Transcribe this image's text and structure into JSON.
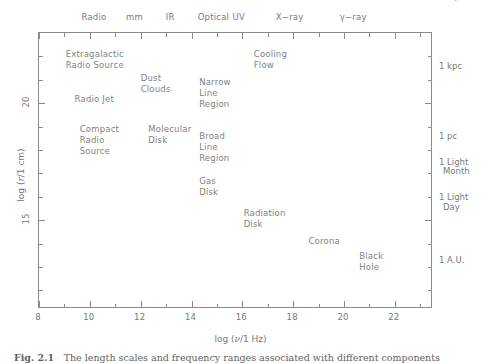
{
  "figure": {
    "caption_number": "Fig. 2.1",
    "caption_text": "The length scales and frequency ranges associated with different components"
  },
  "axes": {
    "x_title_prefix": "log (",
    "x_title_var": "ν",
    "x_title_suffix": "/1 Hz)",
    "y_title_prefix": "log (",
    "y_title_var": "r",
    "y_title_suffix": "/1 cm)",
    "x_ticks": [
      {
        "value": 8,
        "label": "8"
      },
      {
        "value": 10,
        "label": "10"
      },
      {
        "value": 12,
        "label": "12"
      },
      {
        "value": 14,
        "label": "14"
      },
      {
        "value": 16,
        "label": "16"
      },
      {
        "value": 18,
        "label": "18"
      },
      {
        "value": 20,
        "label": "20"
      },
      {
        "value": 22,
        "label": "22"
      }
    ],
    "x_minor_ticks": [
      9,
      11,
      13,
      15,
      17,
      19,
      21,
      23
    ],
    "x_range": [
      8,
      23.5
    ],
    "y_ticks": [
      {
        "value": 20,
        "label": "20"
      },
      {
        "value": 15,
        "label": "15"
      }
    ],
    "y_minor_ticks": [
      22,
      21,
      19,
      18,
      17,
      16,
      14,
      13,
      12
    ],
    "y_range": [
      11.2,
      23.0
    ]
  },
  "bands": [
    {
      "label": "Radio",
      "x": 10.2
    },
    {
      "label": "mm",
      "x": 11.8
    },
    {
      "label": "IR",
      "x": 13.2
    },
    {
      "label": "Optical",
      "x": 14.9
    },
    {
      "label": "UV",
      "x": 15.9
    },
    {
      "label": "X−ray",
      "x": 17.9
    },
    {
      "label": "γ−ray",
      "x": 20.4
    }
  ],
  "scale_markers": [
    {
      "line1": "1 Mpc",
      "line2": "",
      "y": 24.5
    },
    {
      "line1": "1 kpc",
      "line2": "",
      "y": 21.5
    },
    {
      "line1": "1 pc",
      "line2": "",
      "y": 18.5
    },
    {
      "line1": "1 Light",
      "line2": "Month",
      "y": 17.4
    },
    {
      "line1": "1 Light",
      "line2": "Day",
      "y": 15.9
    },
    {
      "line1": "1 A.U.",
      "line2": "",
      "y": 13.2
    }
  ],
  "components": [
    {
      "name": "extragalactic-radio-source",
      "lines": [
        "Extragalactic",
        "Radio Source"
      ],
      "x": 9.05,
      "y": 22.3
    },
    {
      "name": "cooling-flow",
      "lines": [
        "Cooling",
        "Flow"
      ],
      "x": 16.45,
      "y": 22.3
    },
    {
      "name": "dust-clouds",
      "lines": [
        "Dust",
        "Clouds"
      ],
      "x": 12.0,
      "y": 21.3
    },
    {
      "name": "narrow-line-region",
      "lines": [
        "Narrow",
        "Line",
        "Region"
      ],
      "x": 14.3,
      "y": 21.1
    },
    {
      "name": "radio-jet",
      "lines": [
        "Radio Jet"
      ],
      "x": 9.4,
      "y": 20.4
    },
    {
      "name": "compact-radio-source",
      "lines": [
        "Compact",
        "Radio",
        "Source"
      ],
      "x": 9.6,
      "y": 19.1
    },
    {
      "name": "molecular-disk",
      "lines": [
        "Molecular",
        "Disk"
      ],
      "x": 12.3,
      "y": 19.1
    },
    {
      "name": "broad-line-region",
      "lines": [
        "Broad",
        "Line",
        "Region"
      ],
      "x": 14.3,
      "y": 18.8
    },
    {
      "name": "gas-disk",
      "lines": [
        "Gas",
        "Disk"
      ],
      "x": 14.3,
      "y": 16.9
    },
    {
      "name": "radiation-disk",
      "lines": [
        "Radiation",
        "Disk"
      ],
      "x": 16.05,
      "y": 15.5
    },
    {
      "name": "corona",
      "lines": [
        "Corona"
      ],
      "x": 18.6,
      "y": 14.3
    },
    {
      "name": "black-hole",
      "lines": [
        "Black",
        "Hole"
      ],
      "x": 20.6,
      "y": 13.7
    }
  ],
  "chart_data": {
    "type": "scatter",
    "title": "",
    "xlabel": "log (ν/1 Hz)",
    "ylabel": "log (r/1 cm)",
    "xlim": [
      8,
      23.5
    ],
    "ylim": [
      11.2,
      23.0
    ],
    "grid": false,
    "legend": "none",
    "xtick_labels": [
      "8",
      "10",
      "12",
      "14",
      "16",
      "18",
      "20",
      "22"
    ],
    "ytick_labels": [
      "20",
      "15"
    ],
    "top_axis_annotations": [
      "Radio",
      "mm",
      "IR",
      "Optical",
      "UV",
      "X−ray",
      "γ−ray"
    ],
    "right_axis_annotations": [
      "1 Mpc",
      "1 kpc",
      "1 pc",
      "1 Light Month",
      "1 Light Day",
      "1 A.U."
    ],
    "annotations": [
      {
        "text": "Extragalactic Radio Source",
        "x": 9.05,
        "y": 22.3
      },
      {
        "text": "Cooling Flow",
        "x": 16.45,
        "y": 22.3
      },
      {
        "text": "Dust Clouds",
        "x": 12.0,
        "y": 21.3
      },
      {
        "text": "Narrow Line Region",
        "x": 14.3,
        "y": 21.1
      },
      {
        "text": "Radio Jet",
        "x": 9.4,
        "y": 20.4
      },
      {
        "text": "Compact Radio Source",
        "x": 9.6,
        "y": 19.1
      },
      {
        "text": "Molecular Disk",
        "x": 12.3,
        "y": 19.1
      },
      {
        "text": "Broad Line Region",
        "x": 14.3,
        "y": 18.8
      },
      {
        "text": "Gas Disk",
        "x": 14.3,
        "y": 16.9
      },
      {
        "text": "Radiation Disk",
        "x": 16.05,
        "y": 15.5
      },
      {
        "text": "Corona",
        "x": 18.6,
        "y": 14.3
      },
      {
        "text": "Black Hole",
        "x": 20.6,
        "y": 13.7
      }
    ]
  }
}
